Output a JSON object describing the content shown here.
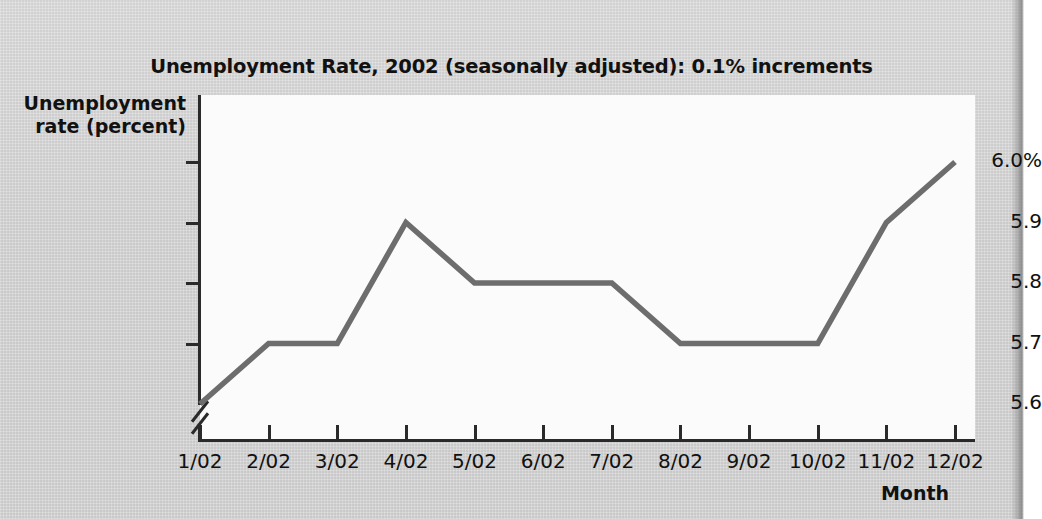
{
  "chart_data": {
    "type": "line",
    "title": "Unemployment Rate, 2002 (seasonally adjusted): 0.1% increments",
    "xlabel": "Month",
    "ylabel": "Unemployment rate (percent)",
    "ylabel_line1": "Unemployment",
    "ylabel_line2": "rate (percent)",
    "categories": [
      "1/02",
      "2/02",
      "3/02",
      "4/02",
      "5/02",
      "6/02",
      "7/02",
      "8/02",
      "9/02",
      "10/02",
      "11/02",
      "12/02"
    ],
    "values": [
      5.6,
      5.7,
      5.7,
      5.9,
      5.8,
      5.8,
      5.8,
      5.7,
      5.7,
      5.7,
      5.9,
      6.0
    ],
    "ytick_values": [
      6.0,
      5.9,
      5.8,
      5.7,
      5.6
    ],
    "ytick_labels": [
      "6.0%",
      "5.9",
      "5.8",
      "5.7",
      "5.6"
    ],
    "ylim": [
      5.6,
      6.0
    ],
    "y_axis_break": true,
    "grid": false,
    "legend": null,
    "series_color": "#6d6d6d",
    "axis_color": "#2a2a2a",
    "plot_background": "#fbfbfb",
    "page_background": "#d3d3d3"
  },
  "show_through_text": "the seasonally adjusted monthly rate for data series published by the bureau and the related tables above illustrate the overall trend in the national figures reported during that calendar year"
}
